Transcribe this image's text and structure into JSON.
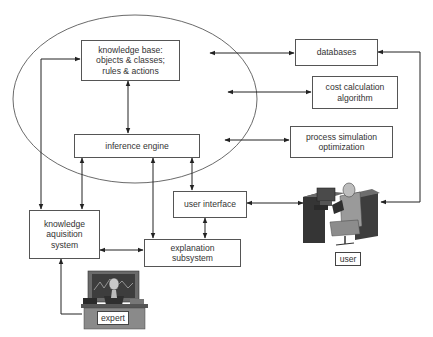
{
  "diagram": {
    "boundary": "expert-system-core",
    "nodes": {
      "knowledge_base": {
        "lines": [
          "knowledge base:",
          "objects & classes;",
          "rules & actions"
        ]
      },
      "inference_engine": {
        "lines": [
          "inference engine"
        ]
      },
      "knowledge_acquisition": {
        "lines": [
          "knowledge",
          "aquisition",
          "system"
        ]
      },
      "user_interface": {
        "lines": [
          "user interface"
        ]
      },
      "explanation": {
        "lines": [
          "explanation",
          "subsystem"
        ]
      },
      "databases": {
        "lines": [
          "databases"
        ]
      },
      "cost_calc": {
        "lines": [
          "cost calculation",
          "algorithm"
        ]
      },
      "process_sim": {
        "lines": [
          "process simulation",
          "optimization"
        ]
      }
    },
    "actors": {
      "user": {
        "label": "user",
        "icon": "person-at-workstation-icon"
      },
      "expert": {
        "label": "expert",
        "icon": "person-at-desk-monitor-icon"
      }
    },
    "edges": [
      {
        "from": "knowledge_base",
        "to": "inference_engine",
        "type": "bidirectional"
      },
      {
        "from": "core",
        "to": "databases",
        "type": "bidirectional"
      },
      {
        "from": "core",
        "to": "cost_calc",
        "type": "bidirectional"
      },
      {
        "from": "core",
        "to": "process_sim",
        "type": "bidirectional"
      },
      {
        "from": "knowledge_acquisition",
        "to": "knowledge_base",
        "type": "bidirectional"
      },
      {
        "from": "inference_engine",
        "to": "knowledge_acquisition",
        "type": "bidirectional"
      },
      {
        "from": "explanation",
        "to": "inference_engine",
        "type": "directed"
      },
      {
        "from": "inference_engine",
        "to": "user_interface",
        "type": "bidirectional"
      },
      {
        "from": "user_interface",
        "to": "explanation",
        "type": "bidirectional"
      },
      {
        "from": "knowledge_acquisition",
        "to": "explanation",
        "type": "bidirectional"
      },
      {
        "from": "user_interface",
        "to": "user",
        "type": "bidirectional"
      },
      {
        "from": "databases",
        "to": "user",
        "type": "bidirectional"
      },
      {
        "from": "expert",
        "to": "knowledge_acquisition",
        "type": "directed"
      }
    ]
  }
}
